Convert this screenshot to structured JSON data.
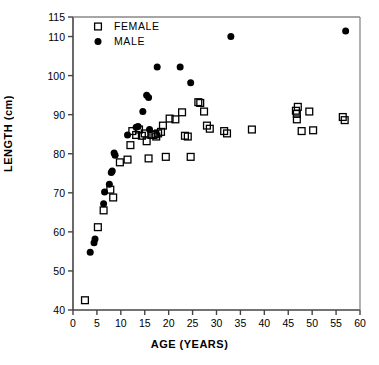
{
  "chart_data": {
    "type": "scatter",
    "title": "",
    "xlabel": "AGE (YEARS)",
    "ylabel": "LENGTH (cm)",
    "xlim": [
      0,
      60
    ],
    "ylim": [
      40,
      115
    ],
    "xticks": [
      0,
      5,
      10,
      15,
      20,
      25,
      30,
      35,
      40,
      45,
      50,
      55,
      60
    ],
    "xtick_labels": [
      "0",
      "5",
      "10",
      "15",
      "20",
      "25",
      "30",
      "35",
      "40",
      "45",
      "50",
      "55",
      "60"
    ],
    "yticks": [
      40,
      50,
      60,
      70,
      80,
      90,
      100,
      110,
      115
    ],
    "ytick_labels": [
      "40",
      "50",
      "60",
      "70",
      "80",
      "90",
      "100",
      "110",
      "115"
    ],
    "grid": false,
    "legend_position": "top-left",
    "series": [
      {
        "name": "FEMALE",
        "marker": "open-square",
        "color": "#000000",
        "points": [
          [
            2.5,
            42.5
          ],
          [
            5.2,
            61.2
          ],
          [
            6.4,
            65.5
          ],
          [
            7.8,
            70.8
          ],
          [
            8.4,
            68.8
          ],
          [
            9.8,
            77.8
          ],
          [
            11.4,
            78.5
          ],
          [
            12.0,
            82.2
          ],
          [
            12.4,
            85.8
          ],
          [
            13.2,
            84.8
          ],
          [
            13.8,
            86.2
          ],
          [
            14.4,
            84.6
          ],
          [
            15.0,
            85.2
          ],
          [
            15.4,
            83.2
          ],
          [
            15.8,
            78.8
          ],
          [
            16.4,
            84.8
          ],
          [
            16.8,
            84.8
          ],
          [
            17.2,
            85.0
          ],
          [
            17.4,
            84.4
          ],
          [
            17.8,
            85.2
          ],
          [
            18.4,
            85.6
          ],
          [
            18.8,
            87.2
          ],
          [
            19.4,
            79.2
          ],
          [
            20.2,
            89.0
          ],
          [
            21.4,
            88.8
          ],
          [
            22.8,
            90.6
          ],
          [
            23.4,
            84.6
          ],
          [
            24.0,
            84.4
          ],
          [
            24.6,
            79.2
          ],
          [
            26.2,
            93.2
          ],
          [
            26.6,
            93.0
          ],
          [
            27.4,
            90.8
          ],
          [
            28.0,
            87.2
          ],
          [
            28.6,
            86.4
          ],
          [
            31.6,
            85.8
          ],
          [
            32.2,
            85.2
          ],
          [
            37.4,
            86.2
          ],
          [
            46.6,
            91.0
          ],
          [
            46.8,
            90.2
          ],
          [
            46.8,
            88.8
          ],
          [
            47.0,
            92.0
          ],
          [
            47.8,
            85.8
          ],
          [
            49.4,
            90.8
          ],
          [
            50.2,
            86.0
          ],
          [
            56.4,
            89.4
          ],
          [
            56.8,
            88.6
          ]
        ]
      },
      {
        "name": "MALE",
        "marker": "filled-circle",
        "color": "#000000",
        "points": [
          [
            3.6,
            54.8
          ],
          [
            4.4,
            57.2
          ],
          [
            4.6,
            58.2
          ],
          [
            6.4,
            67.2
          ],
          [
            6.6,
            70.2
          ],
          [
            7.6,
            72.2
          ],
          [
            8.0,
            75.2
          ],
          [
            8.2,
            75.6
          ],
          [
            8.6,
            80.2
          ],
          [
            8.8,
            79.6
          ],
          [
            11.4,
            84.8
          ],
          [
            13.2,
            86.8
          ],
          [
            13.6,
            87.0
          ],
          [
            14.6,
            90.8
          ],
          [
            15.4,
            95.0
          ],
          [
            15.8,
            94.4
          ],
          [
            16.0,
            86.2
          ],
          [
            17.6,
            102.2
          ],
          [
            22.4,
            102.2
          ],
          [
            24.6,
            98.2
          ],
          [
            33.0,
            110.0
          ],
          [
            57.0,
            111.4
          ]
        ]
      }
    ]
  }
}
